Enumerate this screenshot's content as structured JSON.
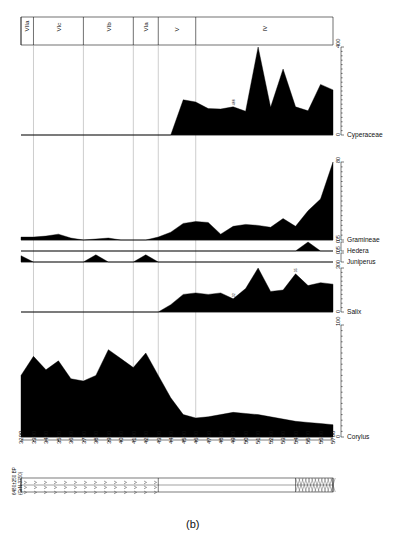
{
  "figure": {
    "caption": "(b)",
    "radiocarbon_label_line1": "6480±250 BP",
    "radiocarbon_label_line2": "(GrN-3750)"
  },
  "zones": [
    {
      "label": "VIIa",
      "x_start": 3200,
      "x_end": 3300
    },
    {
      "label": "VIc",
      "x_start": 3300,
      "x_end": 3700
    },
    {
      "label": "VIb",
      "x_start": 3700,
      "x_end": 4100
    },
    {
      "label": "VIa",
      "x_start": 4100,
      "x_end": 4300
    },
    {
      "label": "V",
      "x_start": 4300,
      "x_end": 4600
    },
    {
      "label": "IV",
      "x_start": 4600,
      "x_end": 5700
    }
  ],
  "x_axis": {
    "label": "",
    "ticks": [
      3200,
      3300,
      3400,
      3500,
      3600,
      3700,
      3800,
      3900,
      4000,
      4100,
      4200,
      4300,
      4400,
      4500,
      4600,
      4700,
      4800,
      4900,
      5000,
      5100,
      5200,
      5300,
      5400,
      5500,
      5600,
      5700
    ],
    "min": 3200,
    "max": 5700
  },
  "lithology": [
    {
      "pattern": "peat",
      "from": 3200,
      "to": 4300
    },
    {
      "pattern": "blank",
      "from": 4300,
      "to": 5400
    },
    {
      "pattern": "hatched",
      "from": 5400,
      "to": 5700
    }
  ],
  "chart_data": [
    {
      "type": "area",
      "title": "Cyperaceae",
      "ylabel": "",
      "xlabel": "",
      "ylim": [
        0,
        400
      ],
      "yticks": [
        0,
        400
      ],
      "annotations": [
        {
          "x": 4900,
          "value": "466"
        }
      ],
      "x": [
        3200,
        3300,
        3400,
        3500,
        3600,
        3700,
        3800,
        3900,
        4000,
        4100,
        4200,
        4300,
        4400,
        4500,
        4600,
        4700,
        4800,
        4900,
        5000,
        5100,
        5200,
        5300,
        5400,
        5500,
        5600,
        5700
      ],
      "values": [
        0,
        0,
        0,
        0,
        0,
        0,
        0,
        0,
        0,
        0,
        0,
        0,
        0,
        160,
        150,
        120,
        118,
        128,
        108,
        400,
        126,
        300,
        128,
        110,
        230,
        205
      ]
    },
    {
      "type": "area",
      "title": "Gramineae",
      "ylim": [
        0,
        80
      ],
      "yticks": [
        0,
        80
      ],
      "annotations": [],
      "x": [
        3200,
        3300,
        3400,
        3500,
        3600,
        3700,
        3800,
        3900,
        4000,
        4100,
        4200,
        4300,
        4400,
        4500,
        4600,
        4700,
        4800,
        4900,
        5000,
        5100,
        5200,
        5300,
        5400,
        5500,
        5600,
        5700
      ],
      "values": [
        3,
        3,
        4,
        6,
        2,
        0,
        1,
        2,
        0,
        0,
        0,
        3,
        8,
        17,
        19,
        18,
        6,
        14,
        16,
        15,
        13,
        22,
        14,
        30,
        42,
        80,
        22,
        20
      ]
    },
    {
      "type": "area",
      "title": "Hedera",
      "ylim": [
        0,
        0.5
      ],
      "yticks": [
        0,
        0.5
      ],
      "annotations": [],
      "x": [
        3200,
        3300,
        3400,
        3500,
        3600,
        3700,
        3800,
        3900,
        4000,
        4100,
        4200,
        4300,
        4400,
        4500,
        4600,
        4700,
        4800,
        4900,
        5000,
        5100,
        5200,
        5300,
        5400,
        5500,
        5600,
        5700
      ],
      "values": [
        0,
        0,
        0,
        0,
        0,
        0,
        0,
        0,
        0,
        0,
        0,
        0,
        0,
        0,
        0,
        0,
        0,
        0,
        0,
        0,
        0,
        0,
        0,
        0.5,
        0,
        0
      ]
    },
    {
      "type": "area",
      "title": "Juniperus",
      "ylim": [
        0,
        0.5
      ],
      "yticks": [
        0,
        0.5
      ],
      "annotations": [],
      "x": [
        3200,
        3300,
        3400,
        3500,
        3600,
        3700,
        3800,
        3900,
        4000,
        4100,
        4200,
        4300,
        4400,
        4500,
        4600,
        4700,
        4800,
        4900,
        5000,
        5100,
        5200,
        5300,
        5400,
        5500,
        5600,
        5700
      ],
      "values": [
        0.35,
        0,
        0,
        0,
        0,
        0,
        0.4,
        0,
        0,
        0,
        0.4,
        0,
        0,
        0,
        0,
        0,
        0,
        0,
        0,
        0,
        0,
        0,
        0,
        0,
        0,
        0
      ]
    },
    {
      "type": "area",
      "title": "Salix",
      "ylim": [
        0,
        30
      ],
      "yticks": [
        0,
        30
      ],
      "annotations": [
        {
          "x": 4900,
          "value": "32"
        },
        {
          "x": 5400,
          "value": "35"
        }
      ],
      "x": [
        3200,
        3300,
        3400,
        3500,
        3600,
        3700,
        3800,
        3900,
        4000,
        4100,
        4200,
        4300,
        4400,
        4500,
        4600,
        4700,
        4800,
        4900,
        5000,
        5100,
        5200,
        5300,
        5400,
        5500,
        5600,
        5700
      ],
      "values": [
        0,
        0,
        0,
        0,
        0,
        0,
        0,
        0,
        0,
        0,
        0,
        0,
        5,
        12,
        13,
        12,
        13,
        9,
        16,
        30,
        14,
        15,
        26,
        18,
        20,
        19
      ]
    },
    {
      "type": "area",
      "title": "Corylus",
      "ylim": [
        0,
        100
      ],
      "yticks": [
        0,
        100
      ],
      "annotations": [],
      "x": [
        3200,
        3300,
        3400,
        3500,
        3600,
        3700,
        3800,
        3900,
        4000,
        4100,
        4200,
        4300,
        4400,
        4500,
        4600,
        4700,
        4800,
        4900,
        5000,
        5100,
        5200,
        5300,
        5400,
        5500,
        5600,
        5700
      ],
      "values": [
        55,
        72,
        60,
        68,
        52,
        50,
        55,
        78,
        70,
        62,
        75,
        55,
        35,
        20,
        17,
        18,
        20,
        22,
        21,
        20,
        18,
        16,
        14,
        13,
        12,
        11
      ]
    }
  ]
}
